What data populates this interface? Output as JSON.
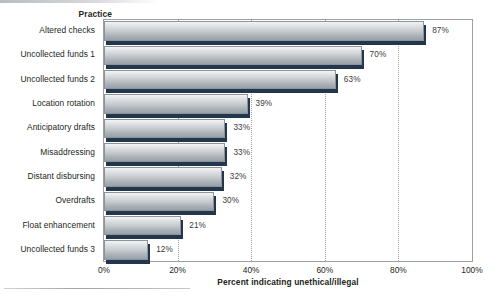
{
  "chart_data": {
    "type": "bar",
    "orientation": "horizontal",
    "title": "",
    "category_axis_title": "Practice",
    "xlabel": "Percent indicating unethical/illegal",
    "ylabel": "Practice",
    "xlim": [
      0,
      100
    ],
    "xticks": [
      "0%",
      "20%",
      "40%",
      "60%",
      "80%",
      "100%"
    ],
    "xtick_values": [
      0,
      20,
      40,
      60,
      80,
      100
    ],
    "grid": "vertical-dotted",
    "legend": "none",
    "categories": [
      "Altered checks",
      "Uncollected funds 1",
      "Uncollected funds 2",
      "Location rotation",
      "Anticipatory drafts",
      "Misaddressing",
      "Distant disbursing",
      "Overdrafts",
      "Float enhancement",
      "Uncollected funds 3"
    ],
    "values": [
      87,
      70,
      63,
      39,
      33,
      33,
      32,
      30,
      21,
      12
    ],
    "value_labels": [
      "87%",
      "70%",
      "63%",
      "39%",
      "33%",
      "33%",
      "32%",
      "30%",
      "21%",
      "12%"
    ],
    "colors": {
      "bar_face_top": "#f3f4f5",
      "bar_face_bottom": "#98a0a8",
      "bar_shadow": "#22364d",
      "plot_border": "#9b9fa4",
      "gridline": "#9ea3a8",
      "text": "#231f20",
      "value_label_text": "#3a3a3c",
      "background": "#ffffff"
    }
  }
}
